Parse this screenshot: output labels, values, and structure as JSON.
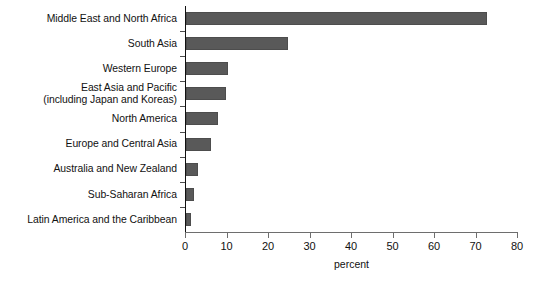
{
  "chart_data": {
    "type": "bar",
    "orientation": "horizontal",
    "title": "",
    "xlabel": "percent",
    "ylabel": "",
    "xlim": [
      0,
      80
    ],
    "xticks": [
      0,
      10,
      20,
      30,
      40,
      50,
      60,
      70,
      80
    ],
    "grid": false,
    "legend": null,
    "bar_color": "#595959",
    "categories": [
      "Middle East and North Africa",
      "South Asia",
      "Western Europe",
      "East Asia and Pacific\n(including Japan and Koreas)",
      "North America",
      "Europe and Central Asia",
      "Australia and New Zealand",
      "Sub-Saharan Africa",
      "Latin America and the Caribbean"
    ],
    "values": [
      72.5,
      24.6,
      10.1,
      9.6,
      7.7,
      6.0,
      3.0,
      2.0,
      1.3
    ]
  }
}
